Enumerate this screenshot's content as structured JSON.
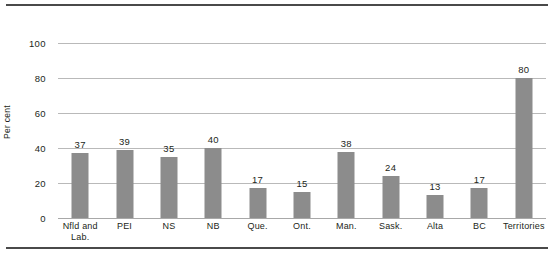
{
  "chart_data": {
    "type": "bar",
    "title": "",
    "subtitle": "",
    "xlabel": "",
    "ylabel": "Per cent",
    "ylim": [
      0,
      110
    ],
    "yticks": [
      0,
      20,
      40,
      60,
      80,
      100
    ],
    "ytick_labels": [
      "0",
      "20",
      "40",
      "60",
      "80",
      "100"
    ],
    "grid": "horizontal",
    "legend": "none",
    "bar_color": "#8c8c8c",
    "gridline_color": "#b9b9b9",
    "rule_color": "#4a4a4a",
    "text_color": "#231f20",
    "show_value_labels": true,
    "categories": [
      "Nfld and Lab.",
      "PEI",
      "NS",
      "NB",
      "Que.",
      "Ont.",
      "Man.",
      "Sask.",
      "Alta",
      "BC",
      "Territories"
    ],
    "category_lines": [
      [
        "Nfld and",
        "Lab."
      ],
      [
        "PEI",
        ""
      ],
      [
        "NS",
        ""
      ],
      [
        "NB",
        ""
      ],
      [
        "Que.",
        ""
      ],
      [
        "Ont.",
        ""
      ],
      [
        "Man.",
        ""
      ],
      [
        "Sask.",
        ""
      ],
      [
        "Alta",
        ""
      ],
      [
        "BC",
        ""
      ],
      [
        "Territories",
        ""
      ]
    ],
    "values": [
      37,
      39,
      35,
      40,
      17,
      15,
      38,
      24,
      13,
      17,
      80
    ],
    "value_labels": [
      "37",
      "39",
      "35",
      "40",
      "17",
      "15",
      "38",
      "24",
      "13",
      "17",
      "80"
    ]
  }
}
